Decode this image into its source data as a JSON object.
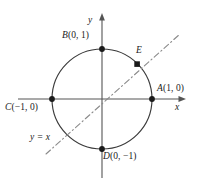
{
  "figure": {
    "background": "#ffffff",
    "stroke_color": "#3a3a3a",
    "axis_color": "#555555",
    "dash_color": "#8a8a8a"
  },
  "axes": {
    "x_label": "x",
    "y_label": "y",
    "origin": {
      "x": 102,
      "y": 99
    },
    "x_range_px": [
      18,
      186
    ],
    "y_range_px": [
      14,
      178
    ]
  },
  "circle": {
    "center_x": 102,
    "center_y": 99,
    "radius": 50,
    "radius_units": 1
  },
  "line": {
    "label": "y = x",
    "equation": "y = x",
    "slope": 1,
    "intercept": 0,
    "style": "dash-dot",
    "start_px": {
      "x": 46,
      "y": 154
    },
    "end_px": {
      "x": 180,
      "y": 34
    }
  },
  "points": [
    {
      "id": "A",
      "label": "A(1, 0)",
      "name": "A",
      "coords": "(1, 0)",
      "x": 1,
      "y": 0,
      "px": 152,
      "py": 99,
      "marker": "dot",
      "label_px": 157,
      "label_py": 84
    },
    {
      "id": "B",
      "label": "B(0, 1)",
      "name": "B",
      "coords": "(0, 1)",
      "x": 0,
      "y": 1,
      "px": 102,
      "py": 49,
      "marker": "dot",
      "label_px": 62,
      "label_py": 31
    },
    {
      "id": "C",
      "label": "C(-1, 0)",
      "name": "C",
      "coords": "(−1, 0)",
      "x": -1,
      "y": 0,
      "px": 52,
      "py": 99,
      "marker": "dot",
      "label_px": 5,
      "label_py": 103
    },
    {
      "id": "D",
      "label": "D(0, -1)",
      "name": "D",
      "coords": "(0, −1)",
      "x": 0,
      "y": -1,
      "px": 102,
      "py": 149,
      "marker": "dot",
      "label_px": 103,
      "label_py": 152
    },
    {
      "id": "E",
      "label": "E",
      "name": "E",
      "coords": "",
      "x": 0.707,
      "y": 0.707,
      "px": 137,
      "py": 64,
      "marker": "square",
      "label_px": 136,
      "label_py": 46
    }
  ],
  "line_label_position": {
    "x": 30,
    "y": 133
  }
}
